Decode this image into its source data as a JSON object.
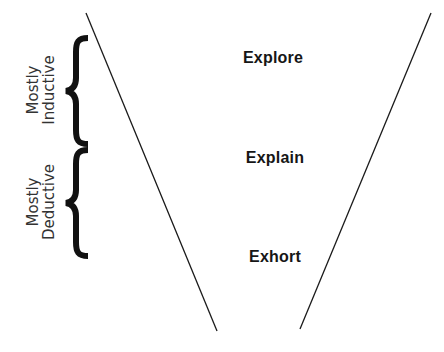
{
  "diagram": {
    "stages": [
      {
        "label": "Explore",
        "x": 273,
        "y": 50
      },
      {
        "label": "Explain",
        "x": 275,
        "y": 151
      },
      {
        "label": "Exhort",
        "x": 275,
        "y": 250
      }
    ],
    "groups": [
      {
        "line1": "Mostly",
        "line2": "Inductive",
        "center_x": 41,
        "center_y": 90
      },
      {
        "line1": "Mostly",
        "line2": "Deductive",
        "center_x": 41,
        "center_y": 202
      }
    ],
    "funnel": {
      "left": {
        "x1": 86,
        "y1": 13,
        "x2": 217,
        "y2": 331
      },
      "right": {
        "x1": 431,
        "y1": 13,
        "x2": 300,
        "y2": 329
      }
    },
    "colors": {
      "line": "#1a1a1a",
      "brace": "#111111",
      "text": "#161616"
    }
  }
}
